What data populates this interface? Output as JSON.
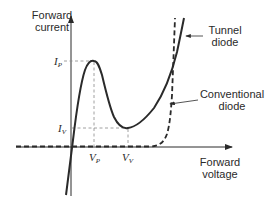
{
  "diagram": {
    "y_axis_label": [
      "Forward",
      "current"
    ],
    "x_axis_label": [
      "Forward",
      "voltage"
    ],
    "curves": [
      {
        "name": "Tunnel diode",
        "label_lines": [
          "Tunnel",
          "diode"
        ],
        "style": "solid"
      },
      {
        "name": "Conventional diode",
        "label_lines": [
          "Conventional",
          "diode"
        ],
        "style": "dashed"
      }
    ],
    "markers": {
      "peak_current": {
        "symbol": "I",
        "sub": "P"
      },
      "valley_current": {
        "symbol": "I",
        "sub": "V"
      },
      "peak_voltage": {
        "symbol": "V",
        "sub": "P"
      },
      "valley_voltage": {
        "symbol": "V",
        "sub": "V"
      }
    },
    "colors": {
      "line": "#2a2a2a",
      "guide": "#888888",
      "background": "#ffffff"
    }
  }
}
